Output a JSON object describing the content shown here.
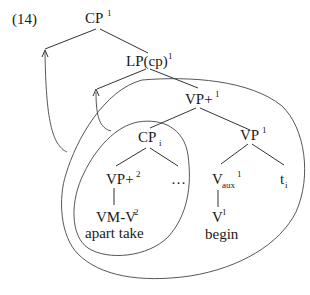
{
  "example_number": "(14)",
  "nodes": {
    "cp_root": {
      "base": "CP",
      "sup": "1"
    },
    "lp": {
      "base": "LP(cp)",
      "sup": "1"
    },
    "vp_plus_1": {
      "base": "VP+",
      "sup": "1"
    },
    "cp_i": {
      "base": "CP",
      "sub": "i"
    },
    "vp_1": {
      "base": "VP",
      "sup": "1"
    },
    "vp_plus_2": {
      "base": "VP+",
      "sup": "2"
    },
    "ellipsis": {
      "base": "…"
    },
    "v_aux": {
      "base": "V",
      "sub": "aux",
      "sup": "1"
    },
    "trace": {
      "base": "t",
      "sub": "i"
    },
    "vm_v": {
      "base": "VM-V",
      "sup": "2"
    },
    "v_1": {
      "base": "V",
      "sup": "1"
    }
  },
  "glosses": {
    "apart_take": "apart take",
    "begin": "begin"
  }
}
